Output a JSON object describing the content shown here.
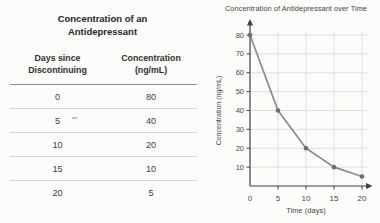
{
  "table": {
    "title_line1": "Concentration of an",
    "title_line2": "Antidepressant",
    "headers": [
      {
        "line1": "Days since",
        "line2": "Discontinuing"
      },
      {
        "line1": "Concentration",
        "line2": "(ng/mL)"
      }
    ],
    "rows": [
      {
        "days": "0",
        "conc": "80"
      },
      {
        "days": "5",
        "conc": "40"
      },
      {
        "days": "10",
        "conc": "20"
      },
      {
        "days": "15",
        "conc": "10"
      },
      {
        "days": "20",
        "conc": "5"
      }
    ]
  },
  "chart_data": {
    "type": "line",
    "title": "Concentration of Antidepressant over Time",
    "xlabel": "Time (days)",
    "ylabel": "Concentration (ng/mL)",
    "x": [
      0,
      5,
      10,
      15,
      20
    ],
    "y": [
      80,
      40,
      20,
      10,
      5
    ],
    "x_ticks": [
      0,
      5,
      10,
      15,
      20
    ],
    "y_ticks": [
      10,
      20,
      30,
      40,
      50,
      60,
      70,
      80
    ],
    "xlim": [
      0,
      21
    ],
    "ylim": [
      0,
      85
    ],
    "grid": true,
    "legend": "none",
    "line_color": "#8a8a8a",
    "marker_color": "#6e6e6e",
    "grid_color": "#d9dde1",
    "axis_color": "#3f3f3f",
    "tick_label_color": "#474747"
  }
}
